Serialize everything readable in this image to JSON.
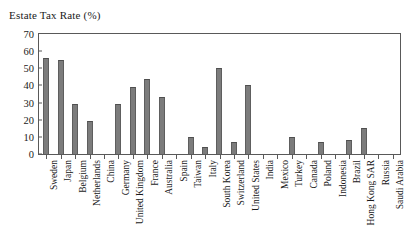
{
  "chart_data": {
    "type": "bar",
    "title": "Estate Tax Rate (%)",
    "xlabel": "",
    "ylabel": "",
    "ylim": [
      0,
      70
    ],
    "ytick_step": 10,
    "yticks": [
      0,
      10,
      20,
      30,
      40,
      50,
      60,
      70
    ],
    "grid": false,
    "legend": null,
    "bar_color": "#7c7c7c",
    "axis_color": "#595959",
    "text_color": "#1a1a1a",
    "categories": [
      "Sweden",
      "Japan",
      "Belgium",
      "Netherlands",
      "China",
      "Germany",
      "United Kingdom",
      "France",
      "Australia",
      "Spain",
      "Taiwan",
      "Italy",
      "South Korea",
      "Switzerland",
      "United States",
      "India",
      "Mexico",
      "Turkey",
      "Canada",
      "Poland",
      "Indonesia",
      "Brazil",
      "Hong Kong SAR",
      "Russia",
      "Saudi Arabia"
    ],
    "values": [
      56,
      55,
      29,
      19,
      0,
      29,
      39,
      44,
      33,
      0,
      10,
      4,
      50,
      7,
      40,
      0,
      0,
      10,
      0,
      7,
      0,
      8,
      15,
      0,
      0
    ]
  }
}
